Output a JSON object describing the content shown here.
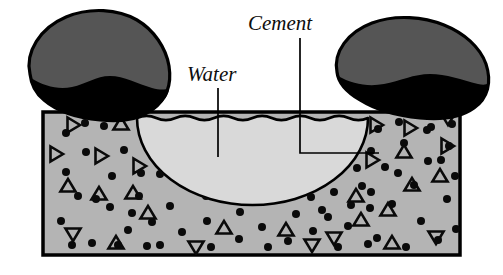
{
  "figure": {
    "type": "cross-section-diagram",
    "width": 503,
    "height": 275,
    "background_color": "#ffffff"
  },
  "labels": {
    "water": {
      "text": "Water",
      "x": 187,
      "y": 81,
      "leader": {
        "x1": 218,
        "y1": 88,
        "x2": 218,
        "y2": 157
      }
    },
    "cement": {
      "text": "Cement",
      "x": 248,
      "y": 30,
      "leader": {
        "x1": 300,
        "y1": 38,
        "x2": 300,
        "y2": 153,
        "x3": 379,
        "y3": 153
      }
    }
  },
  "regions": {
    "cement_paste": {
      "name": "cement paste matrix",
      "fill_color": "#b4b4b4",
      "stroke_color": "#000000",
      "rect": {
        "x": 43,
        "y": 112,
        "width": 417,
        "height": 143
      }
    },
    "water_body": {
      "name": "water pocket",
      "fill_color": "#d9d9d9",
      "stroke_color": "#000000",
      "shape": "semicircular-bowl-with-wavy-top",
      "center_x": 251,
      "top_y": 118,
      "bottom_y": 205,
      "left_x": 137,
      "right_x": 368
    },
    "aggregate_left": {
      "name": "left aggregate rock",
      "fill_color": "#555555",
      "shadow_color": "#000000",
      "stroke_color": "#000000"
    },
    "aggregate_right": {
      "name": "right aggregate rock",
      "fill_color": "#555555",
      "shadow_color": "#000000",
      "stroke_color": "#000000"
    }
  },
  "texture": {
    "dot_color": "#0a0a0a",
    "triangle_stroke_color": "#0a0a0a",
    "dot_radius": 4.0,
    "triangle_size": 13,
    "dots": [
      [
        66,
        133
      ],
      [
        104,
        126
      ],
      [
        124,
        150
      ],
      [
        66,
        172
      ],
      [
        96,
        199
      ],
      [
        61,
        221
      ],
      [
        118,
        245
      ],
      [
        152,
        131
      ],
      [
        141,
        173
      ],
      [
        170,
        206
      ],
      [
        160,
        245
      ],
      [
        186,
        150
      ],
      [
        196,
        185
      ],
      [
        86,
        152
      ],
      [
        112,
        176
      ],
      [
        78,
        196
      ],
      [
        132,
        213
      ],
      [
        92,
        243
      ],
      [
        176,
        124
      ],
      [
        207,
        221
      ],
      [
        182,
        232
      ],
      [
        211,
        247
      ],
      [
        239,
        239
      ],
      [
        262,
        227
      ],
      [
        288,
        241
      ],
      [
        313,
        231
      ],
      [
        338,
        247
      ],
      [
        240,
        212
      ],
      [
        268,
        247
      ],
      [
        296,
        214
      ],
      [
        322,
        210
      ],
      [
        348,
        226
      ],
      [
        368,
        244
      ],
      [
        152,
        222
      ],
      [
        128,
        230
      ],
      [
        206,
        196
      ],
      [
        378,
        129
      ],
      [
        404,
        143
      ],
      [
        431,
        127
      ],
      [
        385,
        167
      ],
      [
        414,
        185
      ],
      [
        441,
        160
      ],
      [
        392,
        204
      ],
      [
        421,
        221
      ],
      [
        447,
        199
      ],
      [
        377,
        238
      ],
      [
        406,
        247
      ],
      [
        438,
        240
      ],
      [
        356,
        137
      ],
      [
        362,
        186
      ],
      [
        370,
        208
      ],
      [
        455,
        176
      ],
      [
        456,
        229
      ],
      [
        452,
        124
      ],
      [
        334,
        192
      ],
      [
        311,
        197
      ],
      [
        357,
        168
      ],
      [
        427,
        130
      ],
      [
        399,
        122
      ],
      [
        371,
        151
      ],
      [
        428,
        161
      ],
      [
        398,
        173
      ],
      [
        351,
        205
      ],
      [
        328,
        217
      ],
      [
        371,
        192
      ],
      [
        449,
        146
      ],
      [
        85,
        123
      ],
      [
        110,
        207
      ],
      [
        139,
        196
      ],
      [
        160,
        174
      ],
      [
        72,
        245
      ],
      [
        147,
        246
      ]
    ],
    "triangles": [
      {
        "x": 73,
        "y": 125,
        "r": 90
      },
      {
        "x": 121,
        "y": 124,
        "r": 0
      },
      {
        "x": 56,
        "y": 154,
        "r": 90
      },
      {
        "x": 101,
        "y": 156,
        "r": 90
      },
      {
        "x": 139,
        "y": 166,
        "r": 90
      },
      {
        "x": 68,
        "y": 186,
        "r": 0
      },
      {
        "x": 99,
        "y": 194,
        "r": 0
      },
      {
        "x": 148,
        "y": 213,
        "r": 0
      },
      {
        "x": 73,
        "y": 234,
        "r": 180
      },
      {
        "x": 116,
        "y": 243,
        "r": 0
      },
      {
        "x": 196,
        "y": 247,
        "r": 180
      },
      {
        "x": 224,
        "y": 228,
        "r": 0
      },
      {
        "x": 286,
        "y": 230,
        "r": 0
      },
      {
        "x": 312,
        "y": 245,
        "r": 180
      },
      {
        "x": 361,
        "y": 220,
        "r": 0
      },
      {
        "x": 376,
        "y": 125,
        "r": 90
      },
      {
        "x": 372,
        "y": 160,
        "r": 90
      },
      {
        "x": 410,
        "y": 128,
        "r": 90
      },
      {
        "x": 447,
        "y": 146,
        "r": 90
      },
      {
        "x": 404,
        "y": 152,
        "r": 0
      },
      {
        "x": 440,
        "y": 176,
        "r": 0
      },
      {
        "x": 412,
        "y": 185,
        "r": 0
      },
      {
        "x": 388,
        "y": 210,
        "r": 0
      },
      {
        "x": 436,
        "y": 237,
        "r": 180
      },
      {
        "x": 392,
        "y": 243,
        "r": 0
      },
      {
        "x": 356,
        "y": 196,
        "r": 0
      },
      {
        "x": 133,
        "y": 193,
        "r": 0
      },
      {
        "x": 448,
        "y": 118,
        "r": 180
      },
      {
        "x": 334,
        "y": 238,
        "r": 180
      }
    ]
  }
}
